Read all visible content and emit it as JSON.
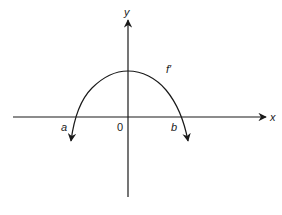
{
  "diagram": {
    "type": "function-graph",
    "axes": {
      "x_label": "x",
      "y_label": "y",
      "origin_label": "0"
    },
    "curve": {
      "label": "f′",
      "shape": "downward-opening parabola",
      "roots": [
        "a",
        "b"
      ]
    },
    "colors": {
      "stroke": "#1a1a1a",
      "background": "#ffffff"
    }
  }
}
